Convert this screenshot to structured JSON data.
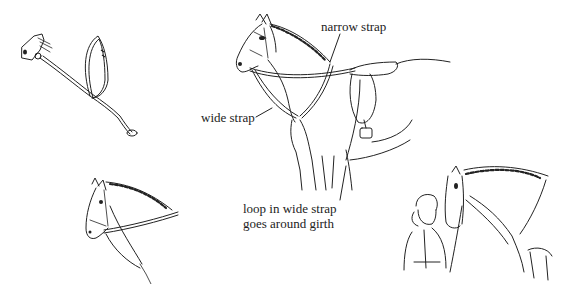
{
  "figure": {
    "panels": [
      {
        "id": "martingale-detached",
        "description": "Martingale shown detached with neck loop, wide strap and end loop, attached at noseband"
      },
      {
        "id": "horse-saddled-labeled",
        "description": "Saddled horse wearing martingale with labeled parts"
      },
      {
        "id": "horse-head-martingale",
        "description": "Horse head and neck with martingale straps"
      },
      {
        "id": "rider-leading-horse",
        "description": "Person in riding hat standing at horse's head adjusting straps"
      }
    ],
    "labels": {
      "narrow_strap": "narrow strap",
      "wide_strap": "wide strap",
      "loop_line1": "loop in wide strap",
      "loop_line2": "goes around girth"
    },
    "colors": {
      "ink": "#222222",
      "background": "#ffffff"
    }
  }
}
